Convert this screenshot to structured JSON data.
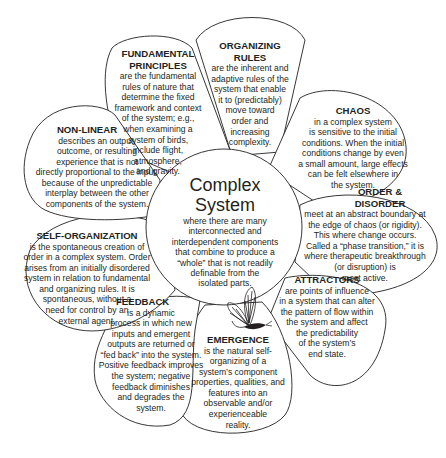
{
  "center": {
    "title": "Complex\nSystem",
    "body": "where there are many\ninterconnected and\ninterdependent components\nthat combine to produce a\n“whole” that is not readily\ndefinable from the\nisolated parts."
  },
  "petals": [
    {
      "id": "fundamental-principles",
      "title": "FUNDAMENTAL\nPRINCIPLES",
      "body": "are the fundamental\nrules of nature that\ndetermine the fixed\nframework and context\nof the system; e.g.,\nwhen examining a\nsystem of birds,\ninclude flight,\natmosphere,\nand gravity."
    },
    {
      "id": "organizing-rules",
      "title": "ORGANIZING\nRULES",
      "body": "are the inherent and\nadaptive rules of the\nsystem that enable\nit to (predictably)\nmove toward\norder and\nincreasing\ncomplexity."
    },
    {
      "id": "chaos",
      "title": "CHAOS",
      "body": "in a complex system\nis sensitive to the initial\nconditions. When the initial\nconditions change by even\na small amount, large effects\ncan be felt elsewhere in\nthe system."
    },
    {
      "id": "order-disorder",
      "title": "ORDER &\nDISORDER",
      "body": "meet at an abstract boundary at\nthe edge of chaos (or rigidity).\nThis where change occurs.\nCalled a “phase transition,” it is\nwhere therapeutic breakthrough\n(or disruption) is\nmost active."
    },
    {
      "id": "attractors",
      "title": "ATTRACTORS",
      "body": "are points of influence\nin a system that can alter\nthe pattern of flow within\nthe system and affect\nthe predictability\nof the system’s\nend state."
    },
    {
      "id": "emergence",
      "title": "EMERGENCE",
      "body": "is the natural self-\norganizing of a\nsystem’s component\nproperties, qualities, and\nfeatures into an\nobservable and/or\nexperienceable\nreality."
    },
    {
      "id": "feedback",
      "title": "FEEDBACK",
      "body": "is a dynamic\nprocess in which new\ninputs and emergent\noutputs are returned or\n“fed back” into the system.\nPositive feedback improves\nthe system; negative\nfeedback diminishes\nand degrades the\nsystem."
    },
    {
      "id": "self-organization",
      "title": "SELF-ORGANIZATION",
      "body": "is the spontaneous creation of\norder in a complex system. Order\narises from an initially disordered\nsystem in relation to fundamental\nand organizing rules. It is\nspontaneous, without a\nneed for control by an\nexternal agent."
    },
    {
      "id": "non-linear",
      "title": "NON-LINEAR",
      "body": "describes an output,\noutcome, or resulting\nexperience that is not\ndirectly proportional to the input,\nbecause of the unpredictable\ninterplay between the other\ncomponents of the system."
    }
  ],
  "icons": {
    "butterfly": "butterfly-illustration"
  },
  "colors": {
    "stroke": "#231f20",
    "fill": "#ffffff",
    "text": "#231f20"
  }
}
